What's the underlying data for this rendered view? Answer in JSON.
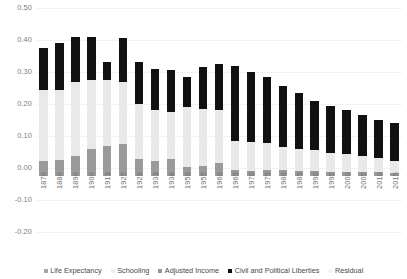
{
  "chart_data": {
    "type": "bar",
    "stacked": true,
    "title": "",
    "xlabel": "",
    "ylabel": "",
    "ylim": [
      -0.2,
      0.5
    ],
    "yticks": [
      "0.50",
      "0.40",
      "0.30",
      "0.20",
      "0.10",
      "0.00",
      "-0.10",
      "-0.20"
    ],
    "ytick_values": [
      0.5,
      0.4,
      0.3,
      0.2,
      0.1,
      0.0,
      -0.1,
      -0.2
    ],
    "grid": true,
    "legend_position": "bottom",
    "categories": [
      "1870",
      "1880",
      "1890",
      "1900",
      "1913",
      "1925",
      "1929",
      "1933",
      "1938",
      "1950",
      "1955",
      "1960",
      "1965",
      "1970",
      "1975",
      "1980",
      "1985",
      "1990",
      "1995",
      "2000",
      "2005",
      "2010",
      "2015"
    ],
    "series": [
      {
        "name": "Life Expectancy",
        "color": "#a6a6a6",
        "values": [
          0.0,
          0.0,
          0.0,
          0.0,
          0.0,
          0.0,
          0.0,
          0.0,
          0.0,
          0.0,
          0.0,
          0.0,
          0.0,
          0.0,
          0.0,
          0.0,
          0.0,
          0.0,
          0.0,
          0.0,
          0.0,
          0.0,
          0.0
        ]
      },
      {
        "name": "Schooling",
        "color": "#e8e8e8",
        "values": [
          0.0,
          0.0,
          0.0,
          0.0,
          0.0,
          0.0,
          0.0,
          0.0,
          0.0,
          0.0,
          0.0,
          0.0,
          0.0,
          0.0,
          0.0,
          0.0,
          0.0,
          0.0,
          0.0,
          0.0,
          0.0,
          0.0,
          0.0
        ]
      },
      {
        "name": "Adjusted Income",
        "color": "#969696",
        "values": [
          0.048,
          0.05,
          0.062,
          0.085,
          0.095,
          0.1,
          0.052,
          0.048,
          0.053,
          0.029,
          0.03,
          0.04,
          0.018,
          0.015,
          0.02,
          0.018,
          0.016,
          0.015,
          0.014,
          0.013,
          0.012,
          0.011,
          0.01
        ]
      },
      {
        "name": "Civil and Political Liberties",
        "color": "#111111",
        "values": [
          0.13,
          0.15,
          0.165,
          0.17,
          0.082,
          0.175,
          0.21,
          0.19,
          0.185,
          0.22,
          0.255,
          0.25,
          0.255,
          0.235,
          0.23,
          0.205,
          0.19,
          0.17,
          0.16,
          0.15,
          0.14,
          0.13,
          0.125
        ]
      },
      {
        "name": "Residual",
        "color": "#f0f0f0",
        "values": [
          0.222,
          0.22,
          0.208,
          0.18,
          0.178,
          0.155,
          0.095,
          0.095,
          0.092,
          0.06,
          0.055,
          0.06,
          0.072,
          0.075,
          0.06,
          0.057,
          0.054,
          0.05,
          0.046,
          0.042,
          0.038,
          0.034,
          0.03
        ]
      }
    ],
    "bar_totals": [
      0.4,
      0.415,
      0.435,
      0.435,
      0.355,
      0.43,
      0.357,
      0.333,
      0.33,
      0.309,
      0.34,
      0.35,
      0.345,
      0.325,
      0.31,
      0.28,
      0.26,
      0.235,
      0.22,
      0.205,
      0.19,
      0.175,
      0.165
    ],
    "segments": [
      {
        "year": "1870",
        "adjusted_income_top": 0.048,
        "light_top": 0.27,
        "black_top": 0.4
      },
      {
        "year": "1880",
        "adjusted_income_top": 0.05,
        "light_top": 0.268,
        "black_top": 0.415
      },
      {
        "year": "1890",
        "adjusted_income_top": 0.062,
        "light_top": 0.295,
        "black_top": 0.435
      },
      {
        "year": "1900",
        "adjusted_income_top": 0.085,
        "light_top": 0.3,
        "black_top": 0.435
      },
      {
        "year": "1913",
        "adjusted_income_top": 0.095,
        "light_top": 0.3,
        "black_top": 0.355
      },
      {
        "year": "1925",
        "adjusted_income_top": 0.1,
        "light_top": 0.295,
        "black_top": 0.43
      },
      {
        "year": "1929",
        "adjusted_income_top": 0.052,
        "light_top": 0.225,
        "black_top": 0.357
      },
      {
        "year": "1933",
        "adjusted_income_top": 0.048,
        "light_top": 0.205,
        "black_top": 0.333
      },
      {
        "year": "1938",
        "adjusted_income_top": 0.053,
        "light_top": 0.2,
        "black_top": 0.33
      },
      {
        "year": "1950",
        "adjusted_income_top": 0.029,
        "light_top": 0.215,
        "black_top": 0.309
      },
      {
        "year": "1955",
        "adjusted_income_top": 0.03,
        "light_top": 0.208,
        "black_top": 0.34
      },
      {
        "year": "1960",
        "adjusted_income_top": 0.04,
        "light_top": 0.205,
        "black_top": 0.35
      },
      {
        "year": "1965",
        "adjusted_income_top": 0.018,
        "light_top": 0.108,
        "black_top": 0.345
      },
      {
        "year": "1970",
        "adjusted_income_top": 0.015,
        "light_top": 0.105,
        "black_top": 0.325
      },
      {
        "year": "1975",
        "adjusted_income_top": 0.02,
        "light_top": 0.102,
        "black_top": 0.31
      },
      {
        "year": "1980",
        "adjusted_income_top": 0.018,
        "light_top": 0.09,
        "black_top": 0.28
      },
      {
        "year": "1985",
        "adjusted_income_top": 0.016,
        "light_top": 0.085,
        "black_top": 0.26
      },
      {
        "year": "1990",
        "adjusted_income_top": 0.015,
        "light_top": 0.082,
        "black_top": 0.235
      },
      {
        "year": "1995",
        "adjusted_income_top": 0.014,
        "light_top": 0.072,
        "black_top": 0.22
      },
      {
        "year": "2000",
        "adjusted_income_top": 0.013,
        "light_top": 0.068,
        "black_top": 0.205
      },
      {
        "year": "2005",
        "adjusted_income_top": 0.012,
        "light_top": 0.062,
        "black_top": 0.19
      },
      {
        "year": "2010",
        "adjusted_income_top": 0.011,
        "light_top": 0.055,
        "black_top": 0.175
      },
      {
        "year": "2015",
        "adjusted_income_top": 0.01,
        "light_top": 0.048,
        "black_top": 0.165
      }
    ]
  },
  "legend": {
    "items": [
      {
        "label": "Life Expectancy",
        "color": "#a6a6a6"
      },
      {
        "label": "Schooling",
        "color": "#ededed"
      },
      {
        "label": "Adjusted Income",
        "color": "#969696"
      },
      {
        "label": "Civil and Political Liberties",
        "color": "#111111"
      },
      {
        "label": "Residual",
        "color": "#f5f5f5"
      }
    ]
  }
}
